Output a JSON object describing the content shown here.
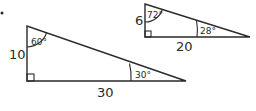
{
  "bullet": "•",
  "triangles": [
    {
      "id": "large",
      "vertical_side": "10",
      "horizontal_side": "30",
      "top_angle": "60°",
      "right_angle_label": "30°"
    },
    {
      "id": "small",
      "vertical_side": "6",
      "horizontal_side": "20",
      "top_angle": "72°",
      "right_angle_label": "28°"
    }
  ],
  "colors": {
    "stroke": "#2a2a2a",
    "background": "#ffffff"
  }
}
